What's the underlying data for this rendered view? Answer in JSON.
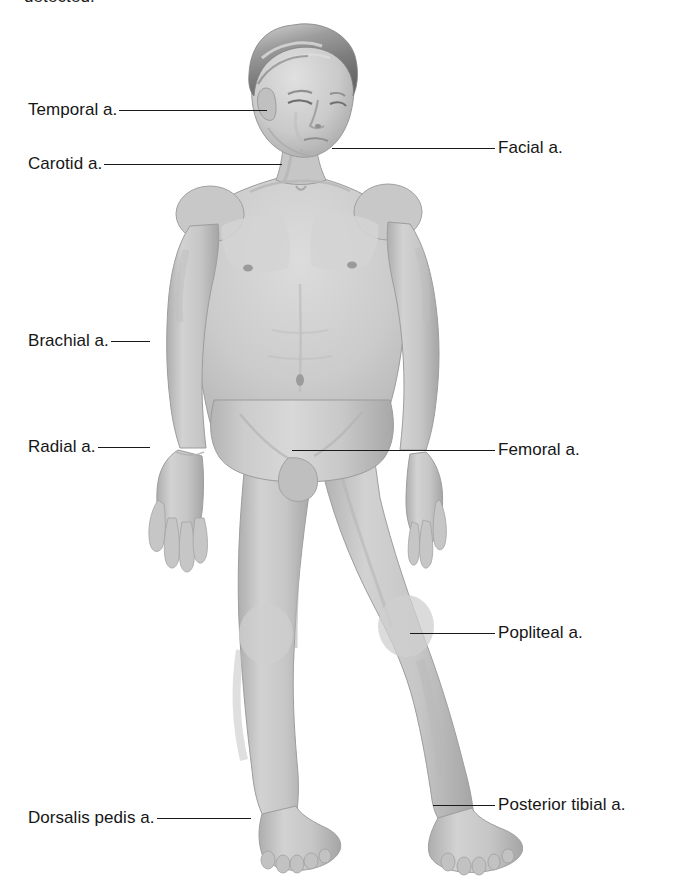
{
  "page": {
    "background_color": "#ffffff",
    "width": 676,
    "height": 896,
    "cropped_caption_text": "detected."
  },
  "figure": {
    "name": "human-body-anterior-view",
    "skin_tone": "#c9c9c9",
    "shadow_tone": "#a3a3a3",
    "hair_tone": "#8f8f8f",
    "outline_color": "#9a9a9a"
  },
  "callouts": {
    "left": [
      {
        "id": "temporal",
        "label": "Temporal a.",
        "label_x": 28,
        "y": 110,
        "leader_end_x": 306
      },
      {
        "id": "carotid",
        "label": "Carotid a.",
        "label_x": 28,
        "y": 164,
        "leader_end_x": 306
      },
      {
        "id": "brachial",
        "label": "Brachial a.",
        "label_x": 28,
        "y": 341,
        "leader_end_x": 197
      },
      {
        "id": "radial",
        "label": "Radial a.",
        "label_x": 28,
        "y": 447,
        "leader_end_x": 182
      },
      {
        "id": "dorsalis-pedis",
        "label": "Dorsalis pedis a.",
        "label_x": 28,
        "y": 818,
        "leader_end_x": 292
      }
    ],
    "right": [
      {
        "id": "facial",
        "label": "Facial a.",
        "label_x": 498,
        "y": 148,
        "leader_start_x": 332
      },
      {
        "id": "femoral",
        "label": "Femoral a.",
        "label_x": 498,
        "y": 450,
        "leader_start_x": 292
      },
      {
        "id": "popliteal",
        "label": "Popliteal a.",
        "label_x": 498,
        "y": 633,
        "leader_start_x": 410
      },
      {
        "id": "posterior-tibial",
        "label": "Posterior tibial a.",
        "label_x": 498,
        "y": 805,
        "leader_start_x": 433
      }
    ]
  }
}
